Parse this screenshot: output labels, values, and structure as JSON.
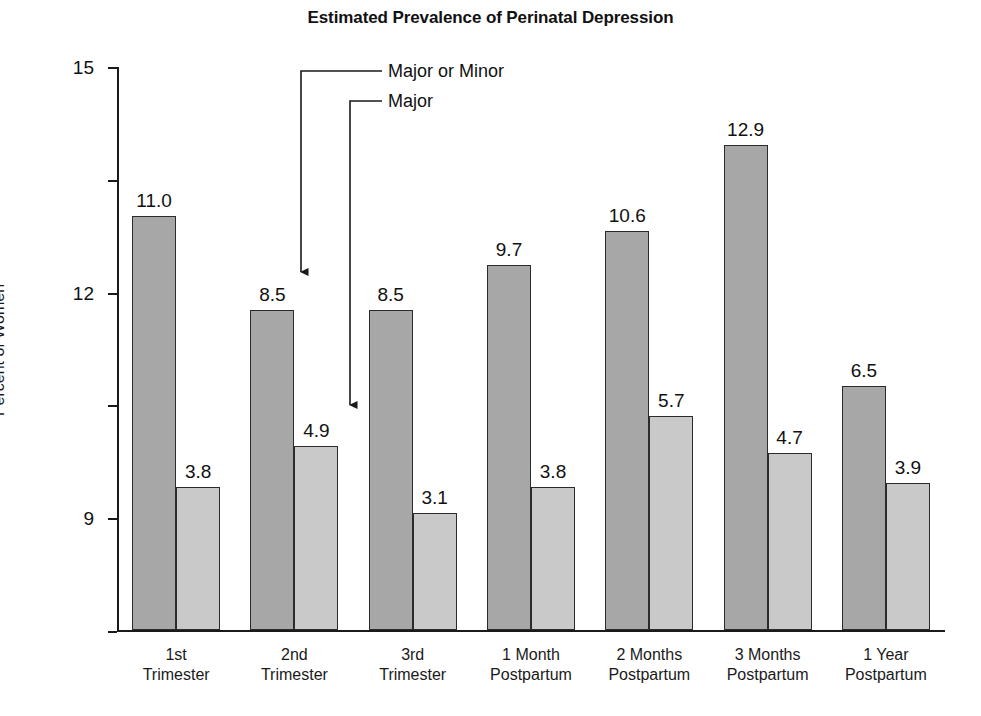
{
  "chart_data": {
    "type": "bar",
    "title": "Estimated Prevalence of Perinatal Depression",
    "xlabel": "",
    "ylabel": "Percent of Women",
    "ylim": [
      0,
      15
    ],
    "yticks": [
      0,
      3,
      6,
      9,
      12,
      15
    ],
    "ytick_labels": [
      "0",
      "3",
      "6",
      "9",
      "12",
      "15"
    ],
    "grid": false,
    "legend_position": "annotation-arrows",
    "categories": [
      "1st Trimester",
      "2nd Trimester",
      "3rd Trimester",
      "1 Month Postpartum",
      "2 Months Postpartum",
      "3 Months Postpartum",
      "1 Year Postpartum"
    ],
    "category_lines": [
      [
        "1st",
        "Trimester"
      ],
      [
        "2nd",
        "Trimester"
      ],
      [
        "3rd",
        "Trimester"
      ],
      [
        "1 Month",
        "Postpartum"
      ],
      [
        "2 Months",
        "Postpartum"
      ],
      [
        "3 Months",
        "Postpartum"
      ],
      [
        "1 Year",
        "Postpartum"
      ]
    ],
    "series": [
      {
        "name": "Major or Minor",
        "color": "#a7a7a7",
        "values": [
          11.0,
          8.5,
          8.5,
          9.7,
          10.6,
          12.9,
          6.5
        ],
        "value_labels": [
          "11.0",
          "8.5",
          "8.5",
          "9.7",
          "10.6",
          "12.9",
          "6.5"
        ]
      },
      {
        "name": "Major",
        "color": "#c9c9c9",
        "values": [
          3.8,
          4.9,
          3.1,
          3.8,
          5.7,
          4.7,
          3.9
        ],
        "value_labels": [
          "3.8",
          "4.9",
          "3.1",
          "3.8",
          "5.7",
          "4.7",
          "3.9"
        ]
      }
    ],
    "annotations": [
      {
        "label": "Major or Minor",
        "points_to": "2nd Trimester / Major or Minor bar"
      },
      {
        "label": "Major",
        "points_to": "2nd Trimester / Major bar"
      }
    ]
  },
  "colors": {
    "major_or_minor": "#a7a7a7",
    "major": "#c9c9c9",
    "axis": "#1a1a1a",
    "text": "#111111",
    "background": "#ffffff"
  }
}
